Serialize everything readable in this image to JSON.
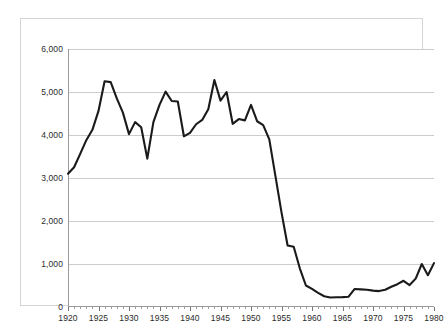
{
  "chart_data": {
    "type": "line",
    "title": "",
    "subtitle": "",
    "xlabel": "",
    "ylabel": "",
    "xlim": [
      1920,
      1980
    ],
    "ylim": [
      0,
      6000
    ],
    "grid": true,
    "legend": false,
    "y_ticks": [
      0,
      1000,
      2000,
      3000,
      4000,
      5000,
      6000
    ],
    "y_tick_labels": [
      "0",
      "1,000",
      "2,000",
      "3,000",
      "4,000",
      "5,000",
      "6,000"
    ],
    "x_ticks": [
      1920,
      1925,
      1930,
      1935,
      1940,
      1945,
      1950,
      1955,
      1960,
      1965,
      1970,
      1975,
      1980
    ],
    "x_tick_labels": [
      "1920",
      "1925",
      "1930",
      "1935",
      "1940",
      "1945",
      "1950",
      "1955",
      "1960",
      "1965",
      "1970",
      "1975",
      "1980"
    ],
    "x_minor_tick_interval": 1,
    "line_color": "#1a1a1a",
    "grid_color": "#cccccc",
    "axis_color": "#9a9a9a",
    "background_color": "#ffffff",
    "x": [
      1920,
      1921,
      1922,
      1923,
      1924,
      1925,
      1926,
      1927,
      1928,
      1929,
      1930,
      1931,
      1932,
      1933,
      1934,
      1935,
      1936,
      1937,
      1938,
      1939,
      1940,
      1941,
      1942,
      1943,
      1944,
      1945,
      1946,
      1947,
      1948,
      1949,
      1950,
      1951,
      1952,
      1953,
      1954,
      1955,
      1956,
      1957,
      1958,
      1959,
      1960,
      1961,
      1962,
      1963,
      1964,
      1965,
      1966,
      1967,
      1968,
      1969,
      1970,
      1971,
      1972,
      1973,
      1974,
      1975,
      1976,
      1977,
      1978,
      1979,
      1980
    ],
    "values": [
      3100,
      3250,
      3560,
      3880,
      4120,
      4560,
      5250,
      5230,
      4850,
      4520,
      4020,
      4300,
      4180,
      3450,
      4300,
      4700,
      5010,
      4790,
      4780,
      3970,
      4050,
      4250,
      4350,
      4600,
      5280,
      4800,
      5000,
      4260,
      4370,
      4340,
      4700,
      4320,
      4230,
      3900,
      3050,
      2200,
      1430,
      1400,
      900,
      500,
      420,
      330,
      250,
      220,
      225,
      230,
      240,
      420,
      410,
      400,
      380,
      370,
      400,
      470,
      530,
      610,
      510,
      660,
      1000,
      740,
      1020
    ]
  }
}
